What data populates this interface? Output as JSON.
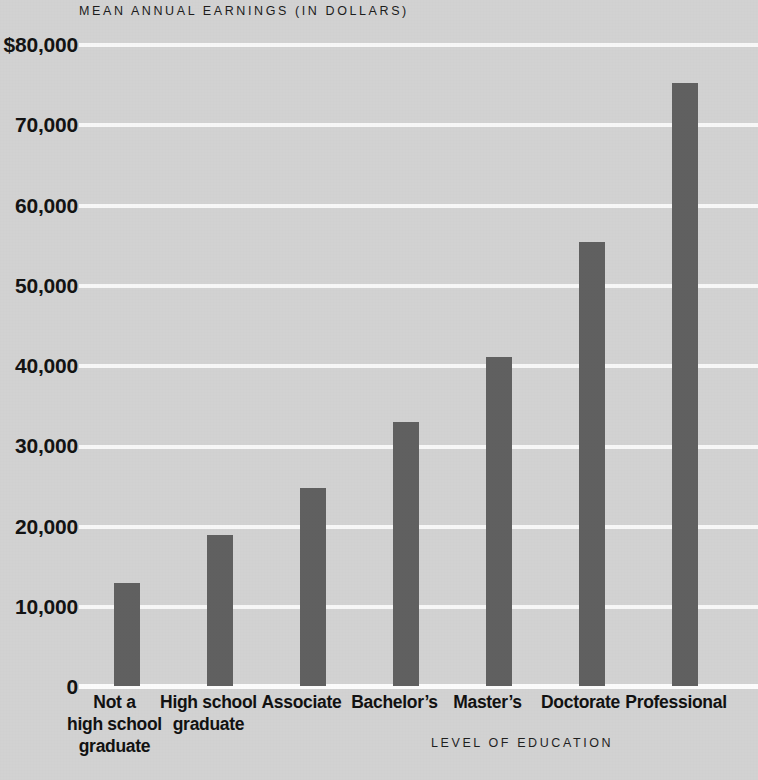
{
  "chart_data": {
    "type": "bar",
    "title": "MEAN ANNUAL EARNINGS (IN DOLLARS)",
    "xlabel": "LEVEL OF EDUCATION",
    "ylabel": "",
    "categories": [
      "Not a\nhigh school\ngraduate",
      "High school\ngraduate",
      "Associate",
      "Bachelor’s",
      "Master’s",
      "Doctorate",
      "Professional"
    ],
    "category_lines": [
      [
        "Not a",
        "high school",
        "graduate"
      ],
      [
        "High school",
        "graduate"
      ],
      [
        "Associate"
      ],
      [
        "Bachelor’s"
      ],
      [
        "Master’s"
      ],
      [
        "Doctorate"
      ],
      [
        "Professional"
      ]
    ],
    "values": [
      12800,
      18800,
      24600,
      32800,
      40900,
      55200,
      75000
    ],
    "ylim": [
      0,
      80000
    ],
    "ytick_values": [
      80000,
      70000,
      60000,
      50000,
      40000,
      30000,
      20000,
      10000,
      0
    ],
    "ytick_labels": [
      "$80,000",
      "70,000",
      "60,000",
      "50,000",
      "40,000",
      "30,000",
      "20,000",
      "10,000",
      "0"
    ],
    "grid": true,
    "legend": "none",
    "bar_color": "#606060",
    "background_color": "#d2d2d2",
    "gridline_color": "#f7f7f7",
    "text_color": "#111111"
  },
  "cat_labels": {
    "c0l0": "Not a",
    "c0l1": "high school",
    "c0l2": "graduate",
    "c1l0": "High school",
    "c1l1": "graduate",
    "c2l0": "Associate",
    "c3l0": "Bachelor’s",
    "c4l0": "Master’s",
    "c5l0": "Doctorate",
    "c6l0": "Professional"
  },
  "yticks": {
    "t0": "$80,000",
    "t1": "70,000",
    "t2": "60,000",
    "t3": "50,000",
    "t4": "40,000",
    "t5": "30,000",
    "t6": "20,000",
    "t7": "10,000",
    "t8": "0"
  }
}
